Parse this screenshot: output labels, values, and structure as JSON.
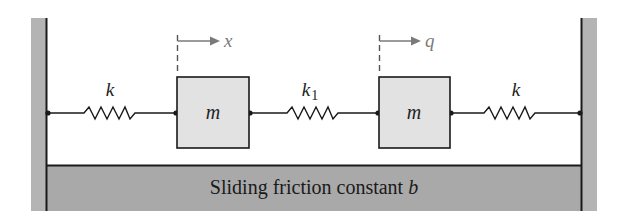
{
  "diagram": {
    "type": "mass-spring system",
    "colors": {
      "wall_fill": "#b4b4b4",
      "floor_fill": "#a9a9a9",
      "mass_fill": "#e2e2e2",
      "line": "#1a1a1a",
      "arrow": "#7a7a7a"
    },
    "springs": [
      {
        "label": "k",
        "subscript": ""
      },
      {
        "label": "k",
        "subscript": "1"
      },
      {
        "label": "k",
        "subscript": ""
      }
    ],
    "masses": [
      {
        "label": "m",
        "displacement": "x"
      },
      {
        "label": "m",
        "displacement": "q"
      }
    ],
    "floor": {
      "text": "Sliding friction constant ",
      "symbol": "b"
    }
  }
}
